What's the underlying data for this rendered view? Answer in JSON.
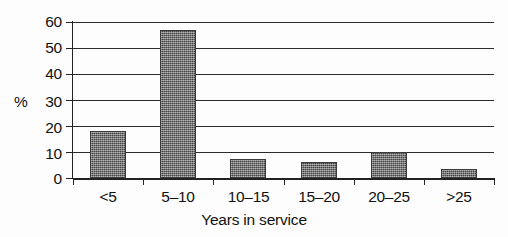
{
  "chart_data": {
    "type": "bar",
    "title": "",
    "subtitle": "",
    "xlabel": "Years in service",
    "ylabel": "%",
    "categories": [
      "<5",
      "5–10",
      "10–15",
      "15–20",
      "20–25",
      ">25"
    ],
    "values": [
      18,
      57,
      7.5,
      6,
      10,
      3.5
    ],
    "series": [
      {
        "name": "Percentage of respondents",
        "values": [
          18,
          57,
          7.5,
          6,
          10,
          3.5
        ]
      }
    ],
    "ylim": [
      0,
      60
    ],
    "ytick_labels": [
      "0",
      "10",
      "20",
      "30",
      "40",
      "50",
      "60"
    ],
    "ytick_values": [
      0,
      10,
      20,
      30,
      40,
      50,
      60
    ],
    "grid": true,
    "grid_axis": "y",
    "legend": false,
    "legend_position": "none",
    "bar_color": "#6d6d6d",
    "bar_edge_color": "#3a3a3a",
    "axis_color": "#222222",
    "background_color": "#fdfdfd"
  }
}
